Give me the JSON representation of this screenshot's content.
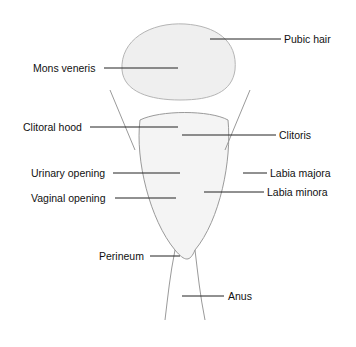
{
  "diagram": {
    "type": "anatomical-illustration",
    "labels": [
      {
        "id": "pubic-hair",
        "text": "Pubic hair",
        "x": 284,
        "y": 33
      },
      {
        "id": "mons-veneris",
        "text": "Mons veneris",
        "x": 33,
        "y": 62
      },
      {
        "id": "clitoral-hood",
        "text": "Clitoral hood",
        "x": 23,
        "y": 122
      },
      {
        "id": "clitoris",
        "text": "Clitoris",
        "x": 279,
        "y": 129
      },
      {
        "id": "urinary-opening",
        "text": "Urinary opening",
        "x": 31,
        "y": 167
      },
      {
        "id": "labia-majora",
        "text": "Labia majora",
        "x": 270,
        "y": 167
      },
      {
        "id": "labia-minora",
        "text": "Labia minora",
        "x": 267,
        "y": 186
      },
      {
        "id": "vaginal-opening",
        "text": "Vaginal opening",
        "x": 31,
        "y": 192
      },
      {
        "id": "perineum",
        "text": "Perineum",
        "x": 99,
        "y": 250
      },
      {
        "id": "anus",
        "text": "Anus",
        "x": 228,
        "y": 290
      }
    ]
  }
}
